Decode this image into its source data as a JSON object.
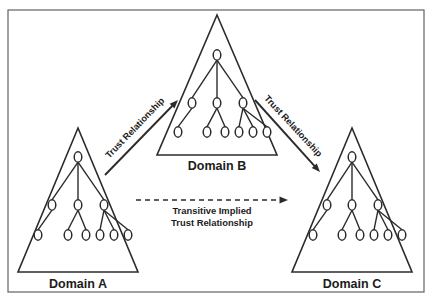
{
  "diagram": {
    "background_color": "#ffffff",
    "frame_color": "#6e6e6e",
    "ink_color": "#2b2b2b",
    "domains": [
      {
        "id": "a",
        "label": "Domain A",
        "label_x": 78,
        "label_y": 288,
        "apex_x": 78,
        "apex_y": 128,
        "base_left_x": 18,
        "base_right_x": 138,
        "base_y": 272,
        "root_x": 78,
        "root_y": 157,
        "branches": [
          {
            "x": 52,
            "y": 205,
            "leaves": [
              {
                "x": 38,
                "y": 235
              }
            ]
          },
          {
            "x": 78,
            "y": 205,
            "leaves": [
              {
                "x": 68,
                "y": 235
              },
              {
                "x": 86,
                "y": 235
              }
            ]
          },
          {
            "x": 104,
            "y": 205,
            "leaves": [
              {
                "x": 100,
                "y": 235
              },
              {
                "x": 114,
                "y": 235
              },
              {
                "x": 128,
                "y": 235
              }
            ]
          }
        ]
      },
      {
        "id": "b",
        "label": "Domain B",
        "label_x": 217,
        "label_y": 170,
        "apex_x": 217,
        "apex_y": 15,
        "base_left_x": 157,
        "base_right_x": 277,
        "base_y": 155,
        "root_x": 217,
        "root_y": 55,
        "branches": [
          {
            "x": 192,
            "y": 103,
            "leaves": [
              {
                "x": 178,
                "y": 132
              }
            ]
          },
          {
            "x": 217,
            "y": 103,
            "leaves": [
              {
                "x": 207,
                "y": 132
              },
              {
                "x": 225,
                "y": 132
              }
            ]
          },
          {
            "x": 243,
            "y": 103,
            "leaves": [
              {
                "x": 239,
                "y": 132
              },
              {
                "x": 253,
                "y": 132
              },
              {
                "x": 267,
                "y": 132
              }
            ]
          }
        ]
      },
      {
        "id": "c",
        "label": "Domain C",
        "label_x": 352,
        "label_y": 288,
        "apex_x": 352,
        "apex_y": 128,
        "base_left_x": 292,
        "base_right_x": 412,
        "base_y": 272,
        "root_x": 352,
        "root_y": 157,
        "branches": [
          {
            "x": 327,
            "y": 205,
            "leaves": [
              {
                "x": 313,
                "y": 235
              }
            ]
          },
          {
            "x": 352,
            "y": 205,
            "leaves": [
              {
                "x": 342,
                "y": 235
              },
              {
                "x": 360,
                "y": 235
              }
            ]
          },
          {
            "x": 378,
            "y": 205,
            "leaves": [
              {
                "x": 374,
                "y": 235
              },
              {
                "x": 388,
                "y": 235
              },
              {
                "x": 402,
                "y": 235
              }
            ]
          }
        ]
      }
    ],
    "relationships": [
      {
        "id": "a-to-b",
        "label": "Trust Relationship",
        "style": "solid",
        "from_domain": "Domain A",
        "to_domain": "Domain B",
        "x1": 105,
        "y1": 175,
        "x2": 178,
        "y2": 100,
        "label_x": 137,
        "label_y": 130,
        "label_rotation": -46
      },
      {
        "id": "b-to-c",
        "label": "Trust Relationship",
        "style": "solid",
        "from_domain": "Domain B",
        "to_domain": "Domain C",
        "x1": 255,
        "y1": 100,
        "x2": 320,
        "y2": 172,
        "label_x": 291,
        "label_y": 128,
        "label_rotation": 47
      },
      {
        "id": "a-to-c",
        "label": "Transitive Implied\nTrust Relationship",
        "label_line1": "Transitive Implied",
        "label_line2": "Trust Relationship",
        "style": "dashed",
        "from_domain": "Domain A",
        "to_domain": "Domain C",
        "x1": 136,
        "y1": 200,
        "x2": 288,
        "y2": 200,
        "label_x": 212,
        "label_y": 214
      }
    ],
    "frame": {
      "x": 8,
      "y": 10,
      "width": 416,
      "height": 282
    }
  }
}
